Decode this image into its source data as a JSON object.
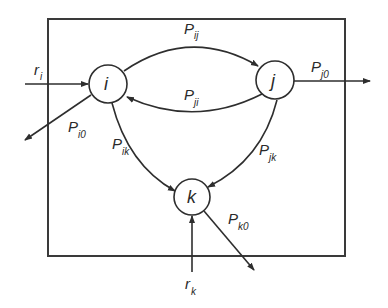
{
  "diagram": {
    "type": "queueing-network",
    "boundary": {
      "x": 48,
      "y": 19,
      "width": 297,
      "height": 237
    },
    "nodes": [
      {
        "id": "i",
        "label": "i",
        "cx": 108,
        "cy": 84,
        "r": 19
      },
      {
        "id": "j",
        "label": "j",
        "cx": 275,
        "cy": 80,
        "r": 19
      },
      {
        "id": "k",
        "label": "k",
        "cx": 192,
        "cy": 197,
        "r": 18
      }
    ],
    "edges": [
      {
        "from": "i",
        "to": "j",
        "label": {
          "main": "P",
          "sub": "ij"
        }
      },
      {
        "from": "j",
        "to": "i",
        "label": {
          "main": "P",
          "sub": "ji"
        }
      },
      {
        "from": "i",
        "to": "k",
        "label": {
          "main": "P",
          "sub": "ik"
        }
      },
      {
        "from": "j",
        "to": "k",
        "label": {
          "main": "P",
          "sub": "jk"
        }
      },
      {
        "from": "i",
        "to": "out",
        "label": {
          "main": "P",
          "sub": "i0"
        }
      },
      {
        "from": "j",
        "to": "out",
        "label": {
          "main": "P",
          "sub": "j0"
        }
      },
      {
        "from": "k",
        "to": "out",
        "label": {
          "main": "P",
          "sub": "k0"
        }
      }
    ],
    "inputs": [
      {
        "to": "i",
        "label": {
          "main": "r",
          "sub": "i"
        }
      },
      {
        "to": "k",
        "label": {
          "main": "r",
          "sub": "k"
        }
      }
    ]
  },
  "labels": {
    "node_i": "i",
    "node_j": "j",
    "node_k": "k",
    "P": "P",
    "r": "r",
    "sub_ij": "ij",
    "sub_ji": "ji",
    "sub_ik": "ik",
    "sub_jk": "jk",
    "sub_i0": "i0",
    "sub_j0": "j0",
    "sub_k0": "k0",
    "sub_i": "i",
    "sub_k": "k"
  }
}
